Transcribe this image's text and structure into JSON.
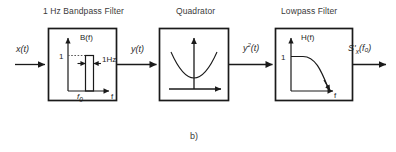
{
  "figure": {
    "caption": "b)",
    "blocks": [
      {
        "id": "bandpass",
        "title": "1 Hz Bandpass Filter",
        "plot": {
          "y_axis_label": "B(f)",
          "x_axis_label": "f",
          "y_tick": "1",
          "x_tick": "f₀",
          "x_tick_base": "f",
          "x_tick_sub": "0",
          "annotation": "1Hz"
        }
      },
      {
        "id": "quadrator",
        "title": "Quadrator",
        "plot": {
          "y_axis_label": "",
          "x_axis_label": ""
        }
      },
      {
        "id": "lowpass",
        "title": "Lowpass Filter",
        "plot": {
          "y_axis_label": "H(f)",
          "x_axis_label": "f",
          "y_tick": "1"
        }
      }
    ],
    "signals": [
      {
        "id": "input",
        "label": "x(t)",
        "base": "x(t)",
        "sup": "",
        "sub": ""
      },
      {
        "id": "after-bandpass",
        "label": "y(t)",
        "base": "y(t)",
        "sup": "",
        "sub": ""
      },
      {
        "id": "after-quadrator",
        "label": "y²(t)",
        "base": "y",
        "sup": "2",
        "rest": "(t)"
      },
      {
        "id": "output",
        "label": "S'ₓ(f₀)",
        "base": "S'",
        "sub": "x",
        "rest": "(f₀)"
      }
    ],
    "colors": {
      "stroke": "#1a1a1a",
      "text": "#2b2b2b",
      "title": "#3a3a3a",
      "background": "#ffffff"
    }
  }
}
